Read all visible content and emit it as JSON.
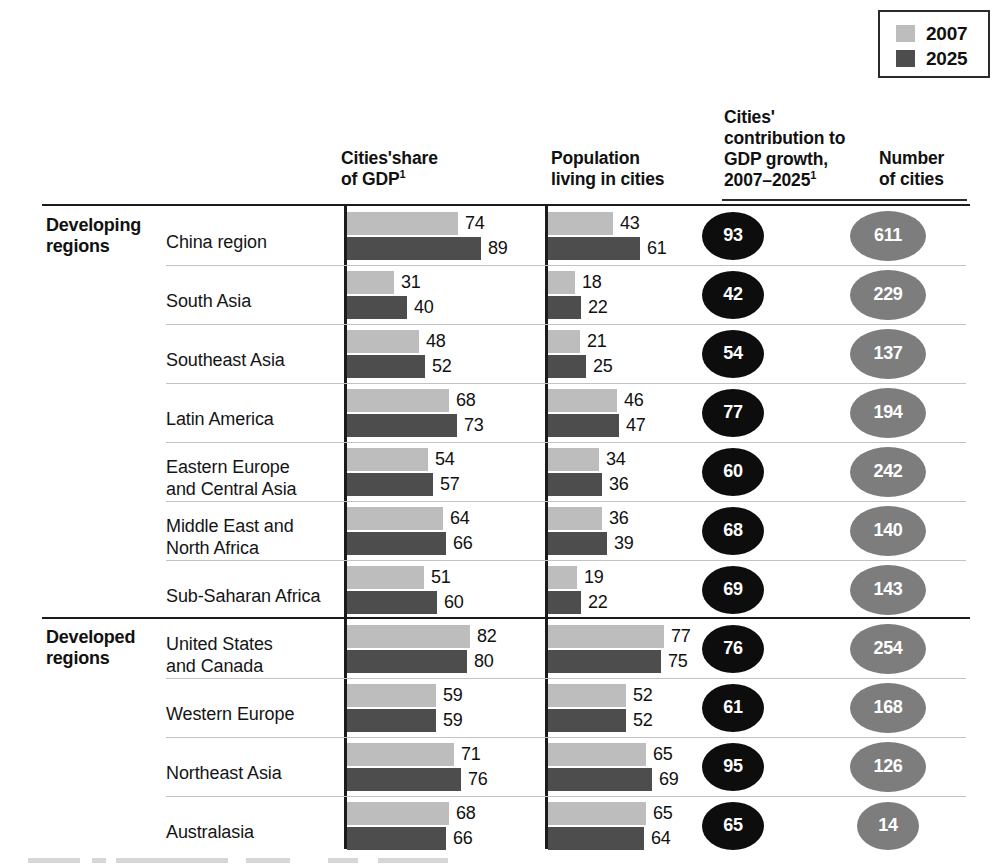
{
  "legend": {
    "items": [
      {
        "label": "2007",
        "color": "#bdbdbd"
      },
      {
        "label": "2025",
        "color": "#4d4d4d"
      }
    ]
  },
  "headers": {
    "gdp_share_line1": "Cities'share",
    "gdp_share_line2": "of GDP",
    "gdp_share_sup": "1",
    "population_line1": "Population",
    "population_line2": "living in cities",
    "contribution_line1": "Cities'",
    "contribution_line2": "contribution to",
    "contribution_line3": "GDP growth,",
    "contribution_line4": "2007–2025",
    "contribution_sup": "1",
    "number_line1": "Number",
    "number_line2": "of cities"
  },
  "groups": [
    {
      "line1": "Developing",
      "line2": "regions"
    },
    {
      "line1": "Developed",
      "line2": "regions"
    }
  ],
  "chart_data": {
    "type": "bar",
    "title": "",
    "xlabel": "",
    "ylabel": "",
    "orientation": "horizontal",
    "grid": false,
    "legend_position": "top-right",
    "series_names": [
      "2007",
      "2025"
    ],
    "series_colors": [
      "#bdbdbd",
      "#4d4d4d"
    ],
    "panels": [
      {
        "key": "gdp_share",
        "name": "Cities'share of GDP",
        "unit": "%",
        "xlim": [
          0,
          100
        ]
      },
      {
        "key": "population",
        "name": "Population living in cities",
        "unit": "%",
        "xlim": [
          0,
          100
        ]
      },
      {
        "key": "contribution",
        "name": "Cities' contribution to GDP growth, 2007-2025",
        "unit": "%",
        "display": "oval-black"
      },
      {
        "key": "number_of_cities",
        "name": "Number of cities",
        "unit": "count",
        "display": "oval-gray"
      }
    ],
    "rows": [
      {
        "group": "Developing regions",
        "region_line1": "China region",
        "region_line2": "",
        "gdp_2007": 74,
        "gdp_2025": 89,
        "pop_2007": 43,
        "pop_2025": 61,
        "contribution": 93,
        "number_of_cities": 611
      },
      {
        "group": "Developing regions",
        "region_line1": "South Asia",
        "region_line2": "",
        "gdp_2007": 31,
        "gdp_2025": 40,
        "pop_2007": 18,
        "pop_2025": 22,
        "contribution": 42,
        "number_of_cities": 229
      },
      {
        "group": "Developing regions",
        "region_line1": "Southeast Asia",
        "region_line2": "",
        "gdp_2007": 48,
        "gdp_2025": 52,
        "pop_2007": 21,
        "pop_2025": 25,
        "contribution": 54,
        "number_of_cities": 137
      },
      {
        "group": "Developing regions",
        "region_line1": "Latin America",
        "region_line2": "",
        "gdp_2007": 68,
        "gdp_2025": 73,
        "pop_2007": 46,
        "pop_2025": 47,
        "contribution": 77,
        "number_of_cities": 194
      },
      {
        "group": "Developing regions",
        "region_line1": "Eastern Europe",
        "region_line2": "and Central Asia",
        "gdp_2007": 54,
        "gdp_2025": 57,
        "pop_2007": 34,
        "pop_2025": 36,
        "contribution": 60,
        "number_of_cities": 242
      },
      {
        "group": "Developing regions",
        "region_line1": "Middle East and",
        "region_line2": "North Africa",
        "gdp_2007": 64,
        "gdp_2025": 66,
        "pop_2007": 36,
        "pop_2025": 39,
        "contribution": 68,
        "number_of_cities": 140
      },
      {
        "group": "Developing regions",
        "region_line1": "Sub-Saharan Africa",
        "region_line2": "",
        "gdp_2007": 51,
        "gdp_2025": 60,
        "pop_2007": 19,
        "pop_2025": 22,
        "contribution": 69,
        "number_of_cities": 143
      },
      {
        "group": "Developed regions",
        "region_line1": "United States",
        "region_line2": "and Canada",
        "gdp_2007": 82,
        "gdp_2025": 80,
        "pop_2007": 77,
        "pop_2025": 75,
        "contribution": 76,
        "number_of_cities": 254
      },
      {
        "group": "Developed regions",
        "region_line1": "Western Europe",
        "region_line2": "",
        "gdp_2007": 59,
        "gdp_2025": 59,
        "pop_2007": 52,
        "pop_2025": 52,
        "contribution": 61,
        "number_of_cities": 168
      },
      {
        "group": "Developed regions",
        "region_line1": "Northeast Asia",
        "region_line2": "",
        "gdp_2007": 71,
        "gdp_2025": 76,
        "pop_2007": 65,
        "pop_2025": 69,
        "contribution": 95,
        "number_of_cities": 126
      },
      {
        "group": "Developed regions",
        "region_line1": "Australasia",
        "region_line2": "",
        "gdp_2007": 68,
        "gdp_2025": 66,
        "pop_2007": 65,
        "pop_2025": 64,
        "contribution": 65,
        "number_of_cities": 14
      }
    ]
  }
}
